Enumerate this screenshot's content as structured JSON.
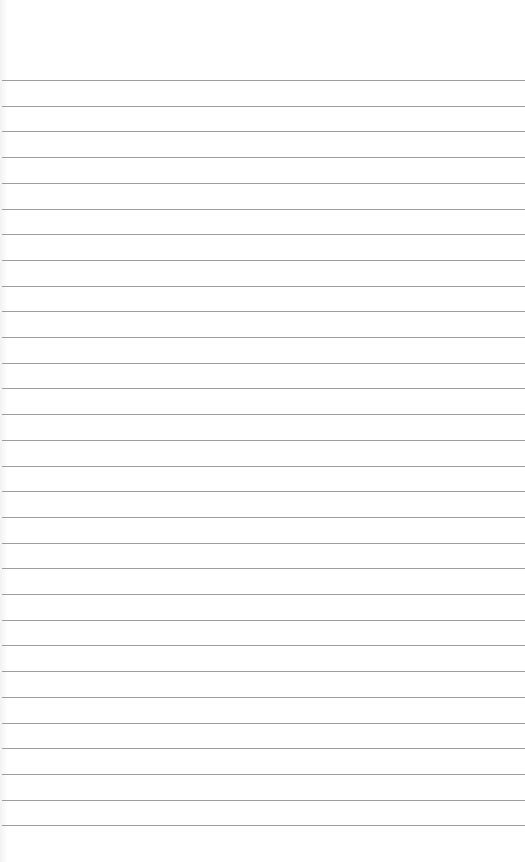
{
  "paper": {
    "type": "lined-paper",
    "background_color": "#ffffff",
    "rule_color": "#8c8c8c",
    "first_rule_y": 80,
    "rule_spacing": 25.7,
    "rule_count": 30
  }
}
